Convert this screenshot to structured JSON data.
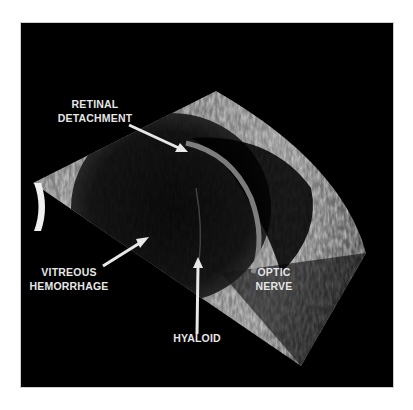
{
  "image": {
    "type": "ocular B-scan ultrasound",
    "background_color": "#000000",
    "label_color": "#e6e6e6"
  },
  "labels": {
    "retinal_detachment": [
      "RETINAL",
      "DETACHMENT"
    ],
    "vitreous_hemorrhage": [
      "VITREOUS",
      "HEMORRHAGE"
    ],
    "optic_nerve": [
      "OPTIC",
      "NERVE"
    ],
    "hyaloid": [
      "HYALOID"
    ]
  }
}
